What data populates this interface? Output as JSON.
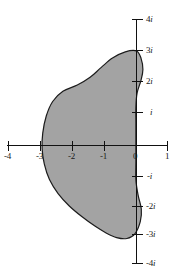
{
  "figure": {
    "title": "",
    "background_color": "#ffffff",
    "width": 170,
    "height": 280
  },
  "chart_data": {
    "type": "scatter",
    "title": "",
    "subtitle": "",
    "xlabel": "",
    "ylabel": "",
    "xlim": [
      -4.3,
      1.2
    ],
    "ylim": [
      -4.3,
      4.3
    ],
    "grid": false,
    "legend": null,
    "plane": "complex-plane",
    "axes": {
      "real_axis": {
        "label": "",
        "ticks": [
          -4,
          -3,
          -2,
          -1,
          0,
          1
        ],
        "tick_labels": [
          "-4",
          "-3",
          "-2",
          "-1",
          "0",
          "1"
        ]
      },
      "imaginary_axis": {
        "label": "",
        "ticks": [
          4,
          3,
          2,
          1,
          -1,
          -2,
          -3,
          -4
        ],
        "tick_labels": [
          "4i",
          "3i",
          "2i",
          "i",
          "-i",
          "-2i",
          "-3i",
          "-4i"
        ]
      }
    },
    "shaded_region": {
      "name": "shaded-region",
      "fill_color": "#a3a3a3",
      "outline_color": "#1c1c1c",
      "description": "Closed shaded blob region spanning roughly real part -3 to 0.2 and imaginary part -3i to 3i",
      "approx_extent": {
        "re_min": -2.95,
        "re_max": 0.2,
        "im_min": -3.0,
        "im_max": 3.05
      },
      "boundary_points": [
        [
          0.0,
          3.05
        ],
        [
          -0.35,
          3.02
        ],
        [
          -0.75,
          2.82
        ],
        [
          -1.1,
          2.52
        ],
        [
          -1.45,
          2.2
        ],
        [
          -1.85,
          1.95
        ],
        [
          -2.3,
          1.75
        ],
        [
          -2.62,
          1.42
        ],
        [
          -2.82,
          0.95
        ],
        [
          -2.93,
          0.4
        ],
        [
          -2.95,
          -0.1
        ],
        [
          -2.88,
          -0.6
        ],
        [
          -2.72,
          -1.1
        ],
        [
          -2.45,
          -1.55
        ],
        [
          -2.1,
          -1.95
        ],
        [
          -1.7,
          -2.3
        ],
        [
          -1.3,
          -2.6
        ],
        [
          -0.95,
          -2.82
        ],
        [
          -0.62,
          -2.97
        ],
        [
          -0.3,
          -3.0
        ],
        [
          -0.05,
          -2.85
        ],
        [
          0.12,
          -2.45
        ],
        [
          0.15,
          -2.05
        ],
        [
          0.05,
          -1.6
        ],
        [
          -0.02,
          -1.1
        ],
        [
          -0.02,
          -0.5
        ],
        [
          -0.02,
          0.1
        ],
        [
          -0.02,
          0.7
        ],
        [
          -0.02,
          1.25
        ],
        [
          0.02,
          1.7
        ],
        [
          0.14,
          2.1
        ],
        [
          0.2,
          2.45
        ],
        [
          0.14,
          2.82
        ]
      ]
    }
  },
  "axis_labels": {
    "real": [
      {
        "name": "x-tick-label-neg4",
        "text": "-4"
      },
      {
        "name": "x-tick-label-neg3",
        "text": "-3"
      },
      {
        "name": "x-tick-label-neg2",
        "text": "-2"
      },
      {
        "name": "x-tick-label-neg1",
        "text": "-1"
      },
      {
        "name": "x-tick-label-0",
        "text": "0"
      },
      {
        "name": "x-tick-label-1",
        "text": "1"
      }
    ],
    "imaginary": [
      {
        "name": "y-tick-label-4i",
        "prefix": "4",
        "unit": "i"
      },
      {
        "name": "y-tick-label-3i",
        "prefix": "3",
        "unit": "i"
      },
      {
        "name": "y-tick-label-2i",
        "prefix": "2",
        "unit": "i"
      },
      {
        "name": "y-tick-label-i",
        "prefix": "",
        "unit": "i"
      },
      {
        "name": "y-tick-label-neg-i",
        "prefix": "-",
        "unit": "i"
      },
      {
        "name": "y-tick-label-neg-2i",
        "prefix": "-2",
        "unit": "i"
      },
      {
        "name": "y-tick-label-neg-3i",
        "prefix": "-3",
        "unit": "i"
      },
      {
        "name": "y-tick-label-neg-4i",
        "prefix": "-4",
        "unit": "i"
      }
    ]
  },
  "colors": {
    "region_fill": "#a3a3a3",
    "region_outline": "#1c1c1c",
    "axis": "#111111",
    "text": "#1a1a1a",
    "background": "#ffffff"
  }
}
